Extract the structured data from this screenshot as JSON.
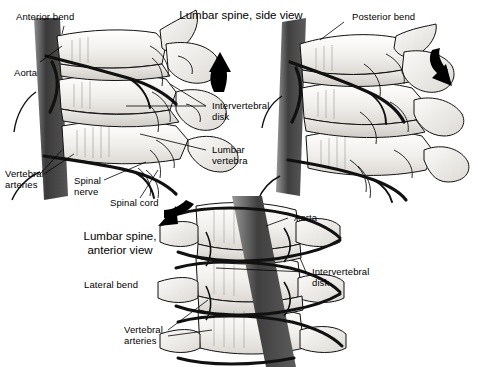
{
  "figure": {
    "type": "medical-illustration",
    "background_color": "#ffffff",
    "ink_color": "#000000",
    "bone_fill": "#f2f1ef",
    "aorta_color": "#4a4a4a",
    "width": 478,
    "height": 367
  },
  "titles": {
    "side_view": "Lumbar spine, side view",
    "anterior_view": "Lumbar spine,\nanterior view"
  },
  "panels": [
    {
      "id": "panel-anterior-bend",
      "name": "Anterior bend (side view, left)",
      "caption": "Anterior bend",
      "arrow": {
        "name": "up-arrow",
        "direction": "up",
        "meaning": "anterior bend motion"
      }
    },
    {
      "id": "panel-posterior-bend",
      "name": "Posterior bend (side view, right)",
      "caption": "Posterior bend",
      "arrow": {
        "name": "down-arrow",
        "direction": "down",
        "meaning": "posterior bend motion"
      }
    },
    {
      "id": "panel-lateral-bend",
      "name": "Lateral bend (anterior view, bottom)",
      "caption": "Lateral bend",
      "arrow": {
        "name": "curved-left-arrow",
        "direction": "down-left",
        "meaning": "lateral bend motion"
      }
    }
  ],
  "labels": {
    "anterior_bend": "Anterior bend",
    "posterior_bend": "Posterior bend",
    "lateral_bend": "Lateral bend",
    "aorta_top": "Aorta",
    "aorta_bottom": "Aorta",
    "intervertebral_disk_top": "Intervertebral\ndisk",
    "intervertebral_disk_bottom": "Intervertebral\ndisk",
    "lumbar_vertebra": "Lumbar\nvertebra",
    "vertebral_arteries_top": "Vertebral\narteries",
    "vertebral_arteries_bottom": "Vertebral\narteries",
    "spinal_nerve": "Spinal\nnerve",
    "spinal_cord": "Spinal cord"
  }
}
